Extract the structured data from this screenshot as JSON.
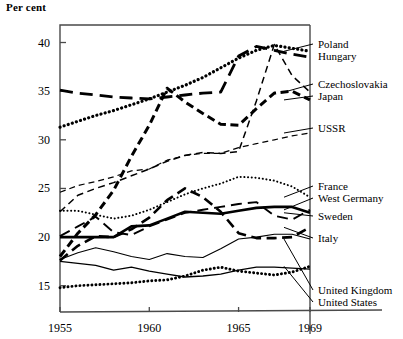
{
  "axis_label_top": "Per cent",
  "y_ticks": [
    {
      "value": 40,
      "label": "40"
    },
    {
      "value": 35,
      "label": "35"
    },
    {
      "value": 30,
      "label": "30"
    },
    {
      "value": 25,
      "label": "25"
    },
    {
      "value": 20,
      "label": "20"
    },
    {
      "value": 15,
      "label": "15"
    }
  ],
  "x_ticks": [
    {
      "value": 1955,
      "label": "1955"
    },
    {
      "value": 1960,
      "label": "1960"
    },
    {
      "value": 1965,
      "label": "1965"
    },
    {
      "value": 1969,
      "label": "1969"
    }
  ],
  "legend": [
    {
      "name": "Poland",
      "label": "Poland",
      "y": 44
    },
    {
      "name": "Hungary",
      "label": "Hungary",
      "y": 56
    },
    {
      "name": "Czechoslovakia",
      "label": "Czechoslovakia",
      "y": 84
    },
    {
      "name": "Japan",
      "label": "Japan",
      "y": 96
    },
    {
      "name": "USSR",
      "label": "USSR",
      "y": 128
    },
    {
      "name": "France",
      "label": "France",
      "y": 186
    },
    {
      "name": "West Germany",
      "label": "West Germany",
      "y": 198
    },
    {
      "name": "Sweden",
      "label": "Sweden",
      "y": 216
    },
    {
      "name": "Italy",
      "label": "Italy",
      "y": 238
    },
    {
      "name": "United Kingdom",
      "label": "United Kingdom",
      "y": 290
    },
    {
      "name": "United States",
      "label": "United States",
      "y": 302
    }
  ],
  "chart_data": {
    "type": "line",
    "title": "",
    "xlabel": "",
    "ylabel": "Per cent",
    "xlim": [
      1955,
      1969
    ],
    "ylim": [
      12.3,
      41.8
    ],
    "grid": false,
    "legend_position": "right-outside-labels",
    "x": [
      1955,
      1956,
      1957,
      1958,
      1959,
      1960,
      1961,
      1962,
      1963,
      1964,
      1965,
      1966,
      1967,
      1968,
      1969
    ],
    "series": [
      {
        "name": "Poland",
        "style": "dotted-thick",
        "values": [
          31.3,
          31.9,
          32.5,
          33.0,
          33.6,
          34.2,
          34.9,
          35.6,
          36.4,
          37.4,
          38.4,
          39.2,
          39.7,
          39.4,
          39.1
        ]
      },
      {
        "name": "Hungary",
        "style": "dashed-long-thick",
        "values": [
          35.1,
          34.8,
          34.6,
          34.4,
          34.3,
          34.2,
          34.4,
          34.6,
          34.8,
          34.9,
          38.6,
          39.6,
          39.2,
          38.8,
          38.5
        ]
      },
      {
        "name": "Czechoslovakia",
        "style": "dashed-fine",
        "values": [
          22.6,
          24.3,
          25.0,
          25.6,
          26.3,
          27.0,
          27.8,
          28.4,
          28.7,
          28.6,
          28.8,
          34.0,
          39.8,
          36.6,
          34.9
        ]
      },
      {
        "name": "Japan",
        "style": "dashed-short-thick",
        "values": [
          18.0,
          20.4,
          22.3,
          24.8,
          28.3,
          31.5,
          35.3,
          33.9,
          32.7,
          31.6,
          31.5,
          33.2,
          34.8,
          35.0,
          34.1
        ]
      },
      {
        "name": "USSR",
        "style": "dashed-thin",
        "values": [
          24.6,
          25.3,
          25.7,
          26.2,
          26.8,
          27.0,
          27.9,
          28.4,
          28.6,
          28.6,
          29.2,
          29.6,
          30.0,
          30.4,
          30.7
        ]
      },
      {
        "name": "France",
        "style": "dotted-fine",
        "values": [
          22.7,
          22.7,
          22.3,
          21.9,
          22.2,
          22.8,
          23.6,
          24.4,
          25.0,
          25.5,
          26.2,
          26.1,
          25.8,
          25.2,
          24.1
        ]
      },
      {
        "name": "West Germany",
        "style": "dashed-long-thin",
        "values": [
          20.1,
          21.1,
          22.1,
          20.5,
          20.2,
          21.1,
          21.8,
          22.5,
          22.8,
          23.1,
          23.4,
          23.6,
          22.2,
          21.8,
          22.8
        ]
      },
      {
        "name": "Sweden",
        "style": "solid-thick",
        "values": [
          20.0,
          20.0,
          20.0,
          20.0,
          21.1,
          21.2,
          21.9,
          22.6,
          22.5,
          22.4,
          22.7,
          23.0,
          23.1,
          23.1,
          22.5
        ]
      },
      {
        "name": "Italy",
        "style": "dashed-medium-thick",
        "values": [
          17.6,
          19.1,
          20.1,
          20.0,
          20.8,
          22.0,
          23.8,
          25.0,
          24.1,
          22.6,
          20.4,
          19.9,
          19.9,
          20.0,
          21.0
        ]
      },
      {
        "name": "United Kingdom",
        "style": "solid-thin",
        "values": [
          17.7,
          18.4,
          18.9,
          18.5,
          18.0,
          17.7,
          18.3,
          18.0,
          17.9,
          18.8,
          19.8,
          20.0,
          20.3,
          20.3,
          19.8
        ]
      },
      {
        "name": "United States",
        "style": "dotted-round",
        "values": [
          14.8,
          15.0,
          15.1,
          15.2,
          15.3,
          15.5,
          15.6,
          16.0,
          16.6,
          16.9,
          16.5,
          16.3,
          16.1,
          16.4,
          17.0
        ]
      },
      {
        "name": "United States Alt",
        "style": "solid-thin-lower",
        "values": [
          17.5,
          17.3,
          17.1,
          16.6,
          16.9,
          16.5,
          16.2,
          15.9,
          16.0,
          16.2,
          16.6,
          16.9,
          16.9,
          16.8,
          16.7
        ]
      }
    ]
  }
}
